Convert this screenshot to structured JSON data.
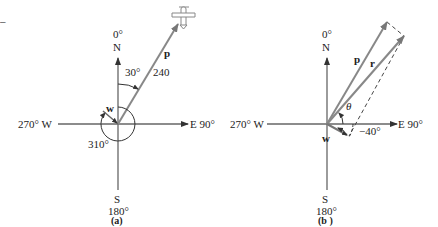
{
  "diagram": {
    "corner_mark": "–",
    "panel_a": {
      "caption": "(a)",
      "north_deg": "0°",
      "north": "N",
      "south": "S",
      "south_deg": "180°",
      "west": "270° W",
      "east": "E 90°",
      "vector_p": "p",
      "vector_w": "w",
      "angle_p": "30°",
      "magnitude_p": "240",
      "angle_w": "310°"
    },
    "panel_b": {
      "caption": "(b )",
      "north_deg": "0°",
      "north": "N",
      "south": "S",
      "south_deg": "180°",
      "west": "270° W",
      "east": "E 90°",
      "vector_p": "p",
      "vector_r": "r",
      "vector_w": "w",
      "angle_theta": "θ",
      "angle_w": "−40°"
    },
    "colors": {
      "axis": "#555555",
      "vector": "#7a7a7a",
      "text": "#222222"
    }
  }
}
